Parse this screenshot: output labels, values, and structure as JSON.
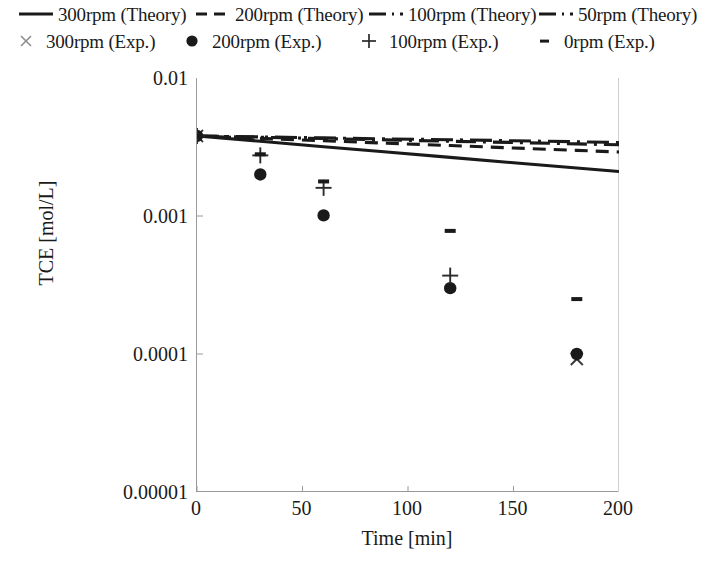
{
  "figure": {
    "type": "scientific-plot",
    "background": "#ffffff",
    "ink_color": "#1a1a1a",
    "axis_color": "#9a9a9a"
  },
  "axes": {
    "x_title": "Time [min]",
    "y_title": "TCE [mol/L]",
    "x_ticks": [
      "0",
      "50",
      "100",
      "150",
      "200"
    ],
    "y_ticks": [
      "0.01",
      "0.001",
      "0.0001",
      "0.00001"
    ]
  },
  "legend": {
    "theory": [
      {
        "label": "300rpm (Theory)",
        "style": "solid",
        "name": "legend-theory-300rpm"
      },
      {
        "label": "200rpm (Theory)",
        "style": "dashed",
        "name": "legend-theory-200rpm"
      },
      {
        "label": "100rpm (Theory)",
        "style": "dash-dot",
        "name": "legend-theory-100rpm"
      },
      {
        "label": "50rpm (Theory)",
        "style": "long-dash-dot",
        "name": "legend-theory-50rpm"
      }
    ],
    "experimental": [
      {
        "label": "300rpm (Exp.)",
        "marker": "x-cross-icon",
        "name": "legend-exp-300rpm"
      },
      {
        "label": "200rpm (Exp.)",
        "marker": "filled-circle-icon",
        "name": "legend-exp-200rpm"
      },
      {
        "label": "100rpm (Exp.)",
        "marker": "plus-icon",
        "name": "legend-exp-100rpm"
      },
      {
        "label": "0rpm (Exp.)",
        "marker": "dash-icon",
        "name": "legend-exp-0rpm"
      }
    ]
  },
  "chart_data": {
    "type": "scatter",
    "title": "",
    "xlabel": "Time [min]",
    "ylabel": "TCE [mol/L]",
    "xlim": [
      0,
      200
    ],
    "ylim": [
      1e-05,
      0.01
    ],
    "yscale": "log",
    "xscale": "linear",
    "xticks": [
      0,
      50,
      100,
      150,
      200
    ],
    "yticks": [
      0.01,
      0.001,
      0.0001,
      1e-05
    ],
    "grid": false,
    "legend_position": "above-plot",
    "series": [
      {
        "name": "300rpm (Theory)",
        "kind": "line",
        "style": "solid",
        "x": [
          0,
          30,
          60,
          90,
          120,
          150,
          180,
          200
        ],
        "y": [
          0.0038,
          0.00348,
          0.00318,
          0.00291,
          0.00266,
          0.00243,
          0.00223,
          0.0021
        ]
      },
      {
        "name": "200rpm (Theory)",
        "kind": "line",
        "style": "dashed",
        "x": [
          0,
          30,
          60,
          90,
          120,
          150,
          180,
          200
        ],
        "y": [
          0.0038,
          0.00365,
          0.00351,
          0.00337,
          0.00324,
          0.00311,
          0.00299,
          0.00291
        ]
      },
      {
        "name": "100rpm (Theory)",
        "kind": "line",
        "style": "dash-dot",
        "x": [
          0,
          30,
          60,
          90,
          120,
          150,
          180,
          200
        ],
        "y": [
          0.0038,
          0.00372,
          0.00364,
          0.00356,
          0.00348,
          0.00341,
          0.00333,
          0.00328
        ]
      },
      {
        "name": "50rpm (Theory)",
        "kind": "line",
        "style": "long-dash-dot",
        "x": [
          0,
          30,
          60,
          90,
          120,
          150,
          180,
          200
        ],
        "y": [
          0.0038,
          0.00374,
          0.00368,
          0.00362,
          0.00357,
          0.00351,
          0.00345,
          0.00341
        ]
      },
      {
        "name": "300rpm (Exp.)",
        "kind": "scatter",
        "marker": "x-cross",
        "x": [
          0,
          180
        ],
        "y": [
          0.0038,
          9.2e-05
        ]
      },
      {
        "name": "200rpm (Exp.)",
        "kind": "scatter",
        "marker": "filled-circle",
        "x": [
          0,
          30,
          60,
          120,
          180
        ],
        "y": [
          0.0038,
          0.002,
          0.00101,
          0.0003,
          0.0001
        ]
      },
      {
        "name": "100rpm (Exp.)",
        "kind": "scatter",
        "marker": "plus",
        "x": [
          0,
          30,
          60,
          120
        ],
        "y": [
          0.0038,
          0.00275,
          0.0016,
          0.00037
        ]
      },
      {
        "name": "0rpm (Exp.)",
        "kind": "scatter",
        "marker": "dash",
        "x": [
          0,
          30,
          60,
          120,
          180
        ],
        "y": [
          0.0038,
          0.0028,
          0.00178,
          0.00078,
          0.00025
        ]
      }
    ]
  }
}
